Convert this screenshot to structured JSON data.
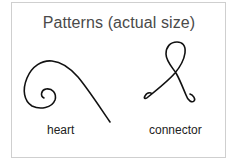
{
  "title": "Patterns (actual size)",
  "patterns": [
    {
      "id": "heart",
      "label": "heart"
    },
    {
      "id": "connector",
      "label": "connector"
    }
  ],
  "colors": {
    "stroke": "#111111",
    "title": "#4a4a4a",
    "border": "#cfcfcf"
  }
}
